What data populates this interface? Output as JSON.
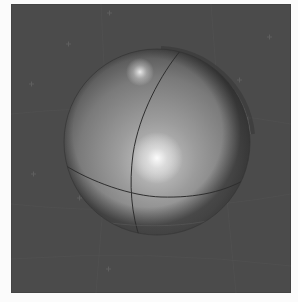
{
  "image": {
    "description": "3D render of a shaded gray sphere with a meridian and equator line on a dark gray background with faint grid",
    "background_color": "#4b4b4b",
    "page_color": "#fbfbfb",
    "sphere": {
      "center_x": 146,
      "center_y": 138,
      "radius": 93,
      "base_color": "#8a8a8a",
      "shadow_color": "#3a3a3a",
      "line_color": "#2e2e2e",
      "highlights": [
        {
          "x": 146,
          "y": 154,
          "r": 26,
          "label": "main-specular"
        },
        {
          "x": 129,
          "y": 68,
          "r": 14,
          "label": "top-specular"
        }
      ]
    },
    "grid_color": "#555555",
    "markers": [
      {
        "x": 57,
        "y": 40
      },
      {
        "x": 98,
        "y": 9
      },
      {
        "x": 20,
        "y": 80
      },
      {
        "x": 96,
        "y": 100
      },
      {
        "x": 22,
        "y": 170
      },
      {
        "x": 68,
        "y": 194
      },
      {
        "x": 258,
        "y": 33
      },
      {
        "x": 228,
        "y": 76
      },
      {
        "x": 237,
        "y": 114
      },
      {
        "x": 97,
        "y": 265
      }
    ]
  }
}
